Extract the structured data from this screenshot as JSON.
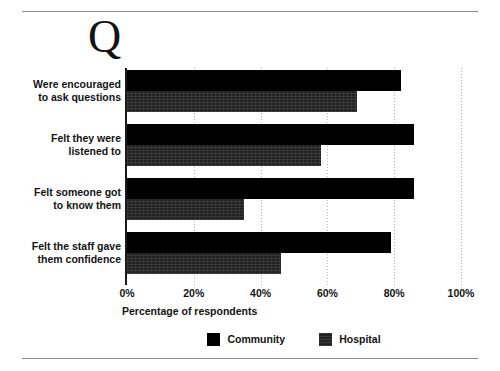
{
  "figure": {
    "marker": "Q",
    "axis_title": "Percentage of respondents"
  },
  "chart_data": {
    "type": "bar",
    "orientation": "horizontal",
    "title": "",
    "subtitle": "",
    "xlabel": "Percentage of respondents",
    "ylabel": "",
    "xlim": [
      0,
      100
    ],
    "grid": "vertical-dotted",
    "legend_position": "bottom-center",
    "categories": [
      "Were encouraged to ask questions",
      "Felt they were listened to",
      "Felt someone got to know them",
      "Felt the staff gave them confidence"
    ],
    "category_lines": [
      [
        "Were encouraged",
        "to ask questions"
      ],
      [
        "Felt they were",
        "listened to"
      ],
      [
        "Felt someone got",
        "to know them"
      ],
      [
        "Felt the staff gave",
        "them confidence"
      ]
    ],
    "tick_labels": [
      "0%",
      "20%",
      "40%",
      "60%",
      "80%",
      "100%"
    ],
    "tick_values": [
      0,
      20,
      40,
      60,
      80,
      100
    ],
    "series": [
      {
        "name": "Community",
        "color": "#000000",
        "values": [
          82,
          86,
          86,
          79
        ]
      },
      {
        "name": "Hospital",
        "color": "#232323",
        "values": [
          69,
          58,
          35,
          46
        ]
      }
    ]
  }
}
